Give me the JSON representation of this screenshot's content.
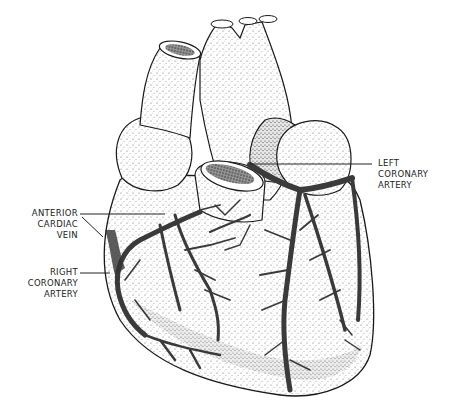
{
  "figure": {
    "style": "stippled pen-and-ink illustration",
    "colors": {
      "ink": "#1a1a1a",
      "background": "#ffffff",
      "vessel": "#3a3a3a"
    }
  },
  "labels": [
    {
      "id": "left-coronary-artery",
      "lines": [
        "LEFT",
        "CORONARY",
        "ARTERY"
      ]
    },
    {
      "id": "anterior-cardiac-vein",
      "lines": [
        "ANTERIOR",
        "CARDIAC",
        "VEIN"
      ]
    },
    {
      "id": "right-coronary-artery",
      "lines": [
        "RIGHT",
        "CORONARY",
        "ARTERY"
      ]
    }
  ]
}
